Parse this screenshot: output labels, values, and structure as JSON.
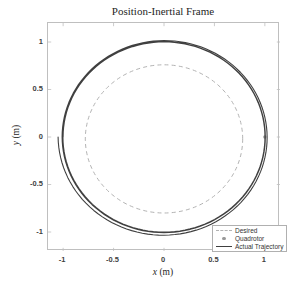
{
  "title": "Position-Inertial Frame",
  "axes": {
    "xlabel_var": "x",
    "xlabel_unit": "(m)",
    "ylabel_var": "y",
    "ylabel_unit": "(m)",
    "x_ticks": [
      "-1",
      "-0.5",
      "0",
      "0.5",
      "1"
    ],
    "y_ticks": [
      "1",
      "0.5",
      "0",
      "-0.5",
      "-1"
    ]
  },
  "legend": {
    "items": [
      {
        "label": "Desired",
        "sample": "dashed-line",
        "color": "#b3b3b3"
      },
      {
        "label": "Quadrotor",
        "sample": "marker",
        "color": "#999999"
      },
      {
        "label": "Actual Trajectory",
        "sample": "solid-line",
        "color": "#404040"
      }
    ],
    "position": "southeast"
  },
  "colors": {
    "desired_line": "#b3b3b3",
    "actual_line": "#404040",
    "marker": "#999999",
    "axes_box": "#bfbfbf",
    "tick_text": "#3f3f3f",
    "label_text": "#262626"
  },
  "chart_data": {
    "type": "line",
    "title": "Position-Inertial Frame",
    "xlabel": "x (m)",
    "ylabel": "y (m)",
    "xlim": [
      -1.15,
      1.15
    ],
    "ylim": [
      -1.2,
      1.2
    ],
    "x_ticks": [
      -1,
      -0.5,
      0,
      0.5,
      1
    ],
    "y_ticks": [
      1,
      0.5,
      0,
      -0.5,
      -1
    ],
    "grid": false,
    "legend_position": "southeast",
    "series": [
      {
        "name": "Desired",
        "shape": "circle",
        "center": [
          0,
          -0.02
        ],
        "radius": 0.78,
        "style": "dashed",
        "color": "#b3b3b3"
      },
      {
        "name": "Quadrotor",
        "shape": "marker",
        "position": [
          1.0,
          0.0
        ],
        "style": "point",
        "color": "#999999"
      },
      {
        "name": "Actual Trajectory",
        "shape": "spiral",
        "center": [
          0,
          0
        ],
        "radius_start": 1.05,
        "radius_end": 1.0,
        "laps": 3,
        "start_angle_deg": 180,
        "decay": 1.6,
        "style": "solid",
        "color": "#404040"
      }
    ]
  }
}
